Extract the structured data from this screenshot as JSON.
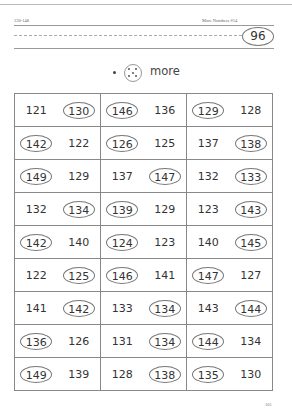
{
  "header": {
    "range": "120-148",
    "title": "More Numbers #14",
    "page_badge": "96"
  },
  "instruction": {
    "icon": "dice-five-icon",
    "label": "more"
  },
  "grid": {
    "rows": [
      [
        {
          "a": "121",
          "a_circled": false,
          "b": "130",
          "b_circled": true
        },
        {
          "a": "146",
          "a_circled": true,
          "b": "136",
          "b_circled": false
        },
        {
          "a": "129",
          "a_circled": true,
          "b": "128",
          "b_circled": false
        }
      ],
      [
        {
          "a": "142",
          "a_circled": true,
          "b": "122",
          "b_circled": false
        },
        {
          "a": "126",
          "a_circled": true,
          "b": "125",
          "b_circled": false
        },
        {
          "a": "137",
          "a_circled": false,
          "b": "138",
          "b_circled": true
        }
      ],
      [
        {
          "a": "149",
          "a_circled": true,
          "b": "129",
          "b_circled": false
        },
        {
          "a": "137",
          "a_circled": false,
          "b": "147",
          "b_circled": true
        },
        {
          "a": "132",
          "a_circled": false,
          "b": "133",
          "b_circled": true
        }
      ],
      [
        {
          "a": "132",
          "a_circled": false,
          "b": "134",
          "b_circled": true
        },
        {
          "a": "139",
          "a_circled": true,
          "b": "129",
          "b_circled": false
        },
        {
          "a": "123",
          "a_circled": false,
          "b": "143",
          "b_circled": true
        }
      ],
      [
        {
          "a": "142",
          "a_circled": true,
          "b": "140",
          "b_circled": false
        },
        {
          "a": "124",
          "a_circled": true,
          "b": "123",
          "b_circled": false
        },
        {
          "a": "140",
          "a_circled": false,
          "b": "145",
          "b_circled": true
        }
      ],
      [
        {
          "a": "122",
          "a_circled": false,
          "b": "125",
          "b_circled": true
        },
        {
          "a": "146",
          "a_circled": true,
          "b": "141",
          "b_circled": false
        },
        {
          "a": "147",
          "a_circled": true,
          "b": "127",
          "b_circled": false
        }
      ],
      [
        {
          "a": "141",
          "a_circled": false,
          "b": "142",
          "b_circled": true
        },
        {
          "a": "133",
          "a_circled": false,
          "b": "134",
          "b_circled": true
        },
        {
          "a": "143",
          "a_circled": false,
          "b": "144",
          "b_circled": true
        }
      ],
      [
        {
          "a": "136",
          "a_circled": true,
          "b": "126",
          "b_circled": false
        },
        {
          "a": "131",
          "a_circled": false,
          "b": "134",
          "b_circled": true
        },
        {
          "a": "144",
          "a_circled": true,
          "b": "134",
          "b_circled": false
        }
      ],
      [
        {
          "a": "149",
          "a_circled": true,
          "b": "139",
          "b_circled": false
        },
        {
          "a": "128",
          "a_circled": false,
          "b": "138",
          "b_circled": true
        },
        {
          "a": "135",
          "a_circled": true,
          "b": "130",
          "b_circled": false
        }
      ]
    ]
  },
  "footer": {
    "page_number": "101"
  }
}
